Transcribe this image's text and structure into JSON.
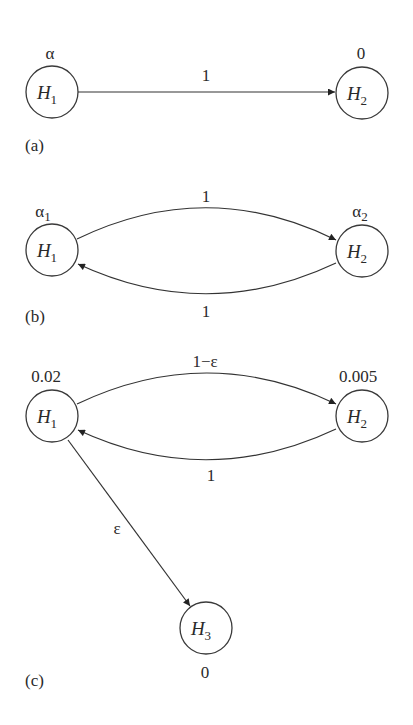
{
  "panels": {
    "a": {
      "label": "(a)",
      "nodes": {
        "h1": {
          "name": "H",
          "sub": "1",
          "value": "α"
        },
        "h2": {
          "name": "H",
          "sub": "2",
          "value": "0"
        }
      },
      "edges": {
        "h1_h2": {
          "label": "1"
        }
      }
    },
    "b": {
      "label": "(b)",
      "nodes": {
        "h1": {
          "name": "H",
          "sub": "1",
          "value": "α",
          "value_sub": "1"
        },
        "h2": {
          "name": "H",
          "sub": "2",
          "value": "α",
          "value_sub": "2"
        }
      },
      "edges": {
        "h1_h2": {
          "label": "1"
        },
        "h2_h1": {
          "label": "1"
        }
      }
    },
    "c": {
      "label": "(c)",
      "nodes": {
        "h1": {
          "name": "H",
          "sub": "1",
          "value": "0.02"
        },
        "h2": {
          "name": "H",
          "sub": "2",
          "value": "0.005"
        },
        "h3": {
          "name": "H",
          "sub": "3",
          "value": "0"
        }
      },
      "edges": {
        "h1_h2": {
          "label": "1−ε"
        },
        "h2_h1": {
          "label": "1"
        },
        "h1_h3": {
          "label": "ε"
        }
      }
    }
  }
}
